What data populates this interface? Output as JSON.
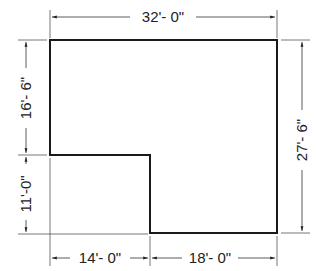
{
  "diagram": {
    "type": "floor-plan-dimensions",
    "colors": {
      "outline": "#1a1a1a",
      "dim_line": "#333333",
      "text": "#222222",
      "background": "#ffffff"
    },
    "dimensions": {
      "top": "32'- 0\"",
      "left_upper": "16'- 6\"",
      "left_lower": "11'-0\"",
      "right": "27'- 6\"",
      "bottom_left": "14'- 0\"",
      "bottom_right": "18'- 0\""
    }
  }
}
